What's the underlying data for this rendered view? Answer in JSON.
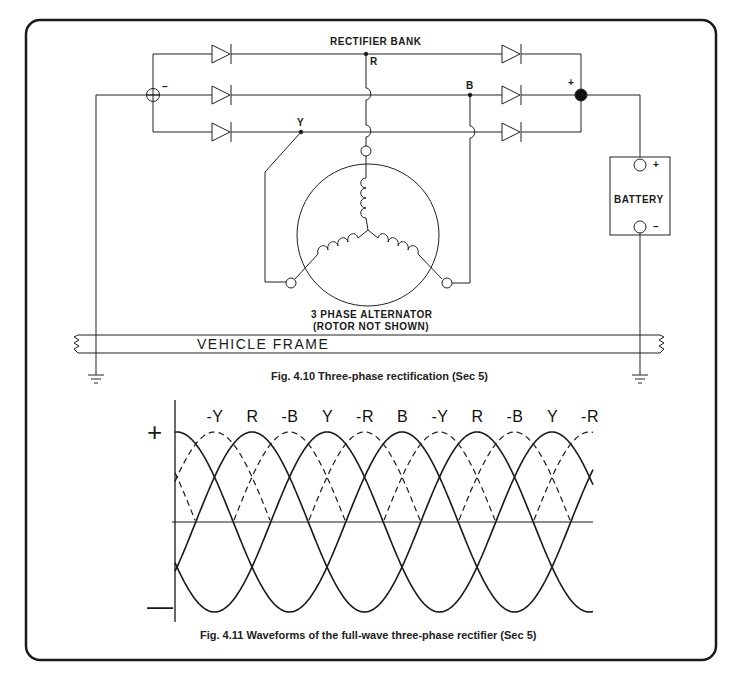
{
  "figure_1": {
    "title_label": "RECTIFIER BANK",
    "nodes": {
      "r": "R",
      "y": "Y",
      "b": "B",
      "negative": "–",
      "positive": "+"
    },
    "battery": {
      "label": "BATTERY",
      "positive": "+",
      "negative": "–"
    },
    "alternator": {
      "line1": "3 PHASE ALTERNATOR",
      "line2": "(ROTOR NOT SHOWN)"
    },
    "frame_label": "VEHICLE FRAME",
    "caption": "Fig. 4.10 Three-phase rectification (Sec 5)"
  },
  "figure_2": {
    "plus_sign": "+",
    "minus_sign": "—",
    "caption": "Fig. 4.11 Waveforms of the full-wave three-phase rectifier (Sec 5)",
    "peak_labels": [
      "-Y",
      "R",
      "-B",
      "Y",
      "-R",
      "B",
      "-Y",
      "R",
      "-B",
      "Y",
      "-R"
    ]
  },
  "chart_data": {
    "type": "line",
    "title": "Waveforms of the full-wave three-phase rectifier",
    "xlabel": "",
    "ylabel": "",
    "y_axis_markers": [
      "+",
      "−"
    ],
    "grid": false,
    "series": [
      {
        "name": "R",
        "style": "solid",
        "phase_deg": 0
      },
      {
        "name": "Y",
        "style": "solid",
        "phase_deg": 120
      },
      {
        "name": "B",
        "style": "solid",
        "phase_deg": 240
      },
      {
        "name": "-R",
        "style": "dashed",
        "phase_deg": 180
      },
      {
        "name": "-Y",
        "style": "dashed",
        "phase_deg": 300
      },
      {
        "name": "-B",
        "style": "dashed",
        "phase_deg": 60
      }
    ],
    "peak_sequence": [
      "-Y",
      "R",
      "-B",
      "Y",
      "-R",
      "B",
      "-Y",
      "R",
      "-B",
      "Y",
      "-R"
    ]
  }
}
